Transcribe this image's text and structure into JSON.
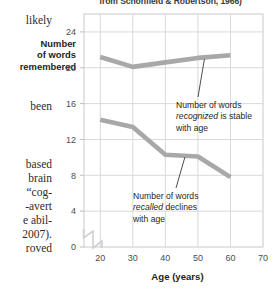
{
  "caption": {
    "text": "from Schonfield & Robertson, 1966)"
  },
  "margin_text": {
    "fragments": [
      {
        "text": "likely",
        "x": 2,
        "y": 14,
        "w": 50
      },
      {
        "text": "been",
        "x": 2,
        "y": 100,
        "w": 50
      },
      {
        "text": "based",
        "x": 2,
        "y": 158,
        "w": 50
      },
      {
        "text": "brain",
        "x": 2,
        "y": 172,
        "w": 50
      },
      {
        "text": "“cog-",
        "x": 2,
        "y": 186,
        "w": 50
      },
      {
        "text": "-avert",
        "x": 2,
        "y": 200,
        "w": 50
      },
      {
        "text": "e abil-",
        "x": 2,
        "y": 214,
        "w": 50
      },
      {
        "text": "2007).",
        "x": 2,
        "y": 228,
        "w": 50
      },
      {
        "text": "roved",
        "x": 2,
        "y": 242,
        "w": 50
      }
    ]
  },
  "chart_data": {
    "type": "line",
    "title": "",
    "xlabel": "Age (years)",
    "ylabel": "Number of words remembered",
    "ylabel_lines": [
      "Number",
      "of words",
      "remembered"
    ],
    "x": [
      20,
      30,
      40,
      50,
      60
    ],
    "xlim": [
      15,
      70
    ],
    "ylim": [
      0,
      26
    ],
    "xticks": [
      20,
      30,
      40,
      50,
      60,
      70
    ],
    "yticks": [
      0,
      4,
      8,
      12,
      16,
      20,
      24
    ],
    "grid": true,
    "axis_break": true,
    "legend": "none",
    "line_color": "#a8a8a8",
    "series": [
      {
        "name": "recognized",
        "values": [
          21.2,
          20.1,
          20.6,
          21.1,
          21.4
        ]
      },
      {
        "name": "recalled",
        "values": [
          14.2,
          13.4,
          10.3,
          10.1,
          7.8
        ]
      }
    ],
    "annotations": [
      {
        "id": "recognized-note",
        "lines": [
          {
            "pre": "Number of words",
            "em": "",
            "post": ""
          },
          {
            "pre": "",
            "em": "recognized",
            "post": " is stable"
          },
          {
            "pre": "with age",
            "em": "",
            "post": ""
          }
        ],
        "target_x": 52,
        "target_y": 21.15
      },
      {
        "id": "recalled-note",
        "lines": [
          {
            "pre": "Number of words",
            "em": "",
            "post": ""
          },
          {
            "pre": "",
            "em": "recalled",
            "post": " declines"
          },
          {
            "pre": "with age",
            "em": "",
            "post": ""
          }
        ],
        "target_x": 46,
        "target_y": 10.2
      }
    ]
  }
}
